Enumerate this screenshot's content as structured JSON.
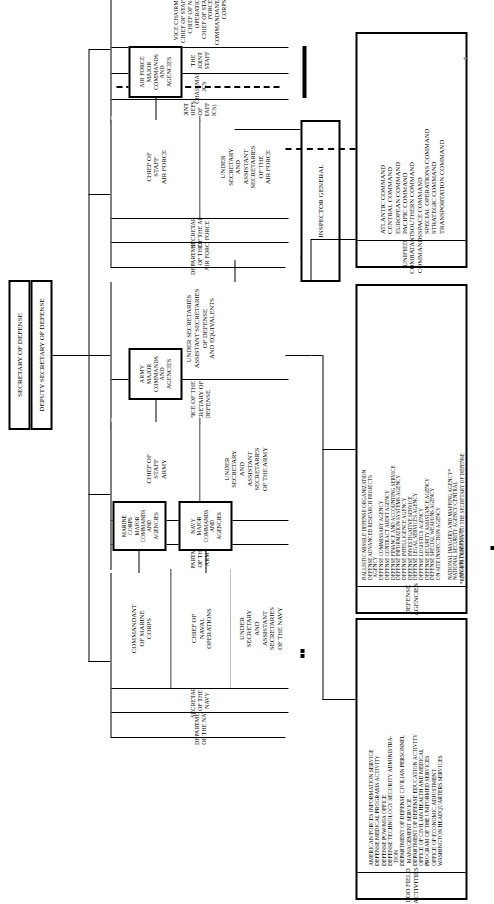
{
  "chart_title": "United States Department of Defense Organization Chart",
  "top": {
    "secretary_of_defense": "SECRETARY OF DEFENSE",
    "deputy_secretary_of_defense": "DEPUTY SECRETARY OF DEFENSE"
  },
  "osd": {
    "header": "OFFICE OF THE\nSECRETARY OF DEFENSE",
    "sub": "UNDER SECRETARIES\nASSISTANT SECRETARIES\nOF DEFENSE\nAND EQUIVALENTS"
  },
  "inspector_general": "INSPECTOR GENERAL",
  "jcs": {
    "header": "JOINT CHIEFS OF STAFF (JCS)",
    "chairman": "CHAIRMAN, JCS",
    "joint_staff": "THE JOINT STAFF",
    "members": "VICE CHAIRMAN, JCS\nCHIEF OF STAFF, ARMY\nCHIEF OF NAVAL OPERATIONS\nCHIEF OF STAFF, AIR FORCE\nCOMMANDANT, MARINE CORPS"
  },
  "departments": [
    {
      "id": "army",
      "department": "DEPARTMENT OF THE ARMY",
      "secretary": "SECRETARY OF THE ARMY",
      "chief": "CHIEF OF\nSTAFF\nARMY",
      "under": "UNDER\nSECRETARY\nAND\nASSISTANT\nSECRETARIES\nOF THE ARMY",
      "commands": [
        "ARMY\nMAJOR\nCOMMANDS\nAND\nAGENCIES"
      ]
    },
    {
      "id": "navy",
      "department": "DEPARTMENT OF THE NAVY",
      "secretary": "SECRETARY OF THE NAVY",
      "chief": "CHIEF OF\nNAVAL\nOPERATIONS",
      "commandant": "COMMANDANT\nOF MARINE\nCORPS",
      "under": "UNDER\nSECRETARY\nAND\nASSISTANT\nSECRETARIES\nOF THE NAVY",
      "commands": [
        "NAVY\nMAJOR\nCOMMANDS\nAND\nAGENCIES",
        "MARINE\nCORPS\nMAJOR\nCOMMANDS\nAND\nAGENCIES"
      ]
    },
    {
      "id": "airforce",
      "department": "DEPARTMENT OF THE\nAIR FORCE",
      "secretary": "SECRETARY OF THE AIR FORCE",
      "chief": "CHIEF OF\nSTAFF\nAIR FORCE",
      "under": "UNDER\nSECRETARY\nAND\nASSISTANT\nSECRETARIES\nOF THE\nAIR FORCE",
      "commands": [
        "AIR FORCE\nMAJOR\nCOMMANDS\nAND\nAGENCIES"
      ]
    }
  ],
  "unified_combatant_commands": {
    "header": "UNIFIED COMBATANT COMMANDS",
    "items": [
      "ATLANTIC COMMAND",
      "CENTRAL COMMAND",
      "EUROPEAN COMMAND",
      "PACIFIC COMMAND",
      "SOUTHERN COMMAND",
      "SPACE COMMAND",
      "SPECIAL OPERATIONS COMMAND",
      "STRATEGIC COMMAND",
      "TRANSPORTATION COMMAND"
    ]
  },
  "defense_agencies": {
    "header": "DEFENSE AGENCIES",
    "items": [
      "BALLISTIC MISSILE DEFENSE ORGANIZATION",
      "DEFENSE ADVANCED RESEARCH PROJECTS",
      "  AGENCY",
      "DEFENSE COMMISSARY AGENCY",
      "DEFENSE CONTRACT AUDIT AGENCY",
      "DEFENSE FINANCE AND ACCOUNTING SERVICE",
      "DEFENSE INFORMATION SYSTEMS AGENCY",
      "DEFENSE INTELLIGENCE AGENCY",
      "DEFENSE INVESTIGATIVE SERVICE",
      "DEFENSE LEGAL SERVICES AGENCY",
      "DEFENSE LOGISTICS AGENCY",
      "DEFENSE SECURITY ASSISTANCE AGENCY",
      "DEFENSE SPECIAL WEAPONS AGENCY",
      "ON-SITE INSPECTION AGENCY",
      "",
      "NATIONAL IMAGERY AND MAPPING AGENCY*",
      "NATIONAL SECURITY AGENCY/CENTRAL",
      "  SECURITY SERVICE*"
    ],
    "footnote": "*REPORTS DIRECTLY TO THE SECRETARY OF DEFENSE"
  },
  "dod_field_activities": {
    "header": "DOD FIELD ACTIVITIES",
    "items": [
      "AMERICAN FORCES INFORMATION SERVICE",
      "DEFENSE MEDICAL PROGRAMS ACTIVITY",
      "DEFENSE POW/MIA OFFICE",
      "DEFENSE TECHNOLOGY SECURITY ADMINISTRA-",
      "  TION",
      "DEPARTMENT OF DEFENSE CIVILIAN PERSONNEL",
      "  MANAGEMENT SERVICE",
      "DEPARTMENT OF DEFENSE EDUCATION ACTIVITY",
      "OFFICE OF CIVILIAN HEALTH AND MEDICAL",
      "PROGRAM OF THE UNIFORMED SERVICES",
      "OFFICE OF ECONOMIC ADJUSTMENT",
      "WASHINGTON HEADQUARTERS SERVICES"
    ]
  }
}
